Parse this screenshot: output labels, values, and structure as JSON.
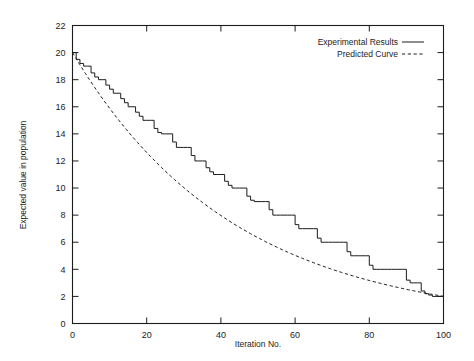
{
  "chart_data": {
    "type": "line",
    "title": "",
    "xlabel": "Iteration No.",
    "ylabel": "Expected value in population",
    "xlim": [
      0,
      100
    ],
    "ylim": [
      0,
      22
    ],
    "xticks": [
      0,
      20,
      40,
      60,
      80,
      100
    ],
    "yticks": [
      0,
      2,
      4,
      6,
      8,
      10,
      12,
      14,
      16,
      18,
      20,
      22
    ],
    "xtick_labels": [
      "0",
      "20",
      "40",
      "60",
      "80",
      "100"
    ],
    "ytick_labels": [
      "0",
      "2",
      "4",
      "6",
      "8",
      "10",
      "12",
      "14",
      "16",
      "18",
      "20",
      "22"
    ],
    "grid": false,
    "legend_position": "top-right",
    "legend": [
      {
        "name": "Experimental Results",
        "style": "solid"
      },
      {
        "name": "Predicted Curve",
        "style": "dashed"
      }
    ],
    "series": [
      {
        "name": "Experimental Results",
        "style": "solid",
        "step": true,
        "x": [
          0,
          1,
          2,
          3,
          4,
          5,
          6,
          7,
          8,
          9,
          10,
          11,
          12,
          13,
          14,
          15,
          16,
          17,
          18,
          19,
          20,
          21,
          22,
          23,
          24,
          25,
          26,
          27,
          28,
          29,
          30,
          31,
          32,
          33,
          34,
          35,
          36,
          37,
          38,
          39,
          40,
          41,
          42,
          43,
          44,
          45,
          46,
          47,
          48,
          49,
          50,
          51,
          52,
          53,
          54,
          55,
          56,
          57,
          58,
          59,
          60,
          61,
          62,
          63,
          64,
          65,
          66,
          67,
          68,
          69,
          70,
          71,
          72,
          73,
          74,
          75,
          76,
          77,
          78,
          79,
          80,
          81,
          82,
          83,
          84,
          85,
          86,
          87,
          88,
          89,
          90,
          91,
          92,
          93,
          94,
          95,
          96,
          97,
          98,
          99,
          100
        ],
        "y": [
          20.0,
          19.5,
          19.2,
          19.0,
          19.0,
          18.5,
          18.2,
          18.0,
          18.0,
          17.6,
          17.3,
          17.0,
          17.0,
          16.6,
          16.3,
          16.0,
          16.0,
          15.6,
          15.3,
          15.0,
          15.0,
          15.0,
          14.4,
          14.1,
          14.0,
          14.0,
          14.0,
          13.4,
          13.0,
          13.0,
          13.0,
          13.0,
          12.4,
          12.0,
          12.0,
          12.0,
          11.5,
          11.2,
          11.0,
          11.0,
          11.0,
          10.5,
          10.2,
          10.0,
          10.0,
          10.0,
          10.0,
          9.4,
          9.1,
          9.0,
          9.0,
          9.0,
          9.0,
          8.4,
          8.0,
          8.0,
          8.0,
          8.0,
          8.0,
          8.0,
          7.3,
          7.0,
          7.0,
          7.0,
          7.0,
          7.0,
          6.3,
          6.0,
          6.0,
          6.0,
          6.0,
          6.0,
          6.0,
          6.0,
          5.3,
          5.0,
          5.0,
          5.0,
          5.0,
          5.0,
          4.3,
          4.0,
          4.0,
          4.0,
          4.0,
          4.0,
          4.0,
          4.0,
          4.0,
          4.0,
          3.2,
          3.0,
          3.0,
          3.0,
          2.4,
          2.2,
          2.1,
          2.0,
          2.0,
          2.0,
          2.0
        ]
      },
      {
        "name": "Predicted Curve",
        "style": "dashed",
        "formula": "20 * exp(-0.023 * x)",
        "x": [
          0,
          5,
          10,
          15,
          20,
          25,
          30,
          35,
          40,
          45,
          50,
          55,
          60,
          65,
          70,
          75,
          80,
          85,
          90,
          95,
          100
        ],
        "y": [
          20.0,
          17.8,
          15.9,
          14.2,
          12.6,
          11.3,
          10.0,
          8.9,
          8.0,
          7.1,
          6.3,
          5.6,
          5.0,
          4.5,
          4.0,
          3.6,
          3.2,
          2.8,
          2.5,
          2.3,
          2.0
        ]
      }
    ]
  }
}
